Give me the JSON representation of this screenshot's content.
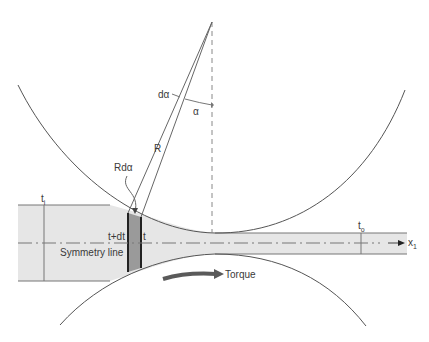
{
  "diagram": {
    "labels": {
      "d_alpha": "dα",
      "alpha": "α",
      "radius": "R",
      "arc_length": "Rdα",
      "entry_thickness_t": "t",
      "entry_thickness_sub": "i",
      "exit_thickness_t": "t",
      "exit_thickness_sub": "o",
      "element_left": "t+dt",
      "element_right": "t",
      "symmetry": "Symmetry line",
      "axis_x": "x",
      "axis_x_sub": "1",
      "torque": "Torque"
    },
    "colors": {
      "strip_fill": "#e6e6e6",
      "element_fill": "#9a9a9a",
      "line": "#555555",
      "torque_arrow": "#5a5a5a"
    }
  }
}
